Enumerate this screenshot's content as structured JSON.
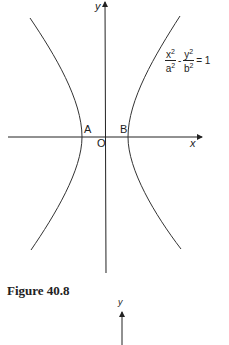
{
  "diagram": {
    "axes": {
      "x_label": "x",
      "y_label": "y",
      "origin_label": "O"
    },
    "points": {
      "A": "A",
      "B": "B"
    },
    "equation": {
      "term1_num": "x",
      "term1_den": "a",
      "term2_num": "y",
      "term2_den": "b",
      "exp": "2",
      "minus": "-",
      "rhs": "= 1"
    },
    "caption": "Figure 40.8",
    "next_figure_y_label": "y"
  }
}
